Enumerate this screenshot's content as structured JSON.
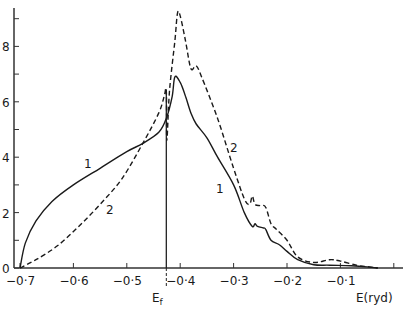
{
  "chart_data": {
    "type": "line",
    "title": "",
    "xlabel": "E(ryd)",
    "ylabel": "",
    "xlim": [
      -0.7,
      0.0
    ],
    "ylim": [
      0,
      9.5
    ],
    "grid": false,
    "x_ticks": [
      "-0·7",
      "-0·6",
      "-0·5",
      "-0·4",
      "-0·3",
      "-0·2",
      "-0·1"
    ],
    "y_ticks": [
      "0",
      "2",
      "4",
      "6",
      "8"
    ],
    "annotations": [
      {
        "text": "E_f",
        "x": -0.426,
        "note": "Fermi energy vertical line"
      },
      {
        "text": "1",
        "series": "1",
        "positions": [
          "left branch",
          "right branch"
        ]
      },
      {
        "text": "2",
        "series": "2",
        "positions": [
          "left branch",
          "right branch"
        ]
      }
    ],
    "series": [
      {
        "name": "1",
        "style": "solid",
        "x": [
          -0.7,
          -0.69,
          -0.67,
          -0.64,
          -0.6,
          -0.55,
          -0.5,
          -0.47,
          -0.44,
          -0.426,
          -0.415,
          -0.41,
          -0.4,
          -0.39,
          -0.38,
          -0.37,
          -0.35,
          -0.33,
          -0.3,
          -0.28,
          -0.265,
          -0.26,
          -0.255,
          -0.245,
          -0.24,
          -0.23,
          -0.215,
          -0.2,
          -0.18,
          -0.15,
          -0.12,
          -0.08,
          -0.05,
          -0.03
        ],
        "y": [
          0.0,
          0.9,
          1.7,
          2.4,
          3.0,
          3.6,
          4.2,
          4.5,
          4.9,
          5.4,
          6.2,
          6.9,
          6.7,
          6.2,
          5.6,
          5.2,
          4.7,
          4.0,
          3.0,
          2.0,
          1.5,
          1.6,
          1.5,
          1.45,
          1.4,
          1.0,
          0.85,
          0.6,
          0.3,
          0.12,
          0.1,
          0.08,
          0.04,
          0.0
        ]
      },
      {
        "name": "2",
        "style": "dashed",
        "x": [
          -0.7,
          -0.67,
          -0.63,
          -0.59,
          -0.55,
          -0.51,
          -0.47,
          -0.44,
          -0.43,
          -0.426,
          -0.425,
          -0.42,
          -0.41,
          -0.405,
          -0.4,
          -0.39,
          -0.38,
          -0.37,
          -0.36,
          -0.33,
          -0.3,
          -0.28,
          -0.27,
          -0.265,
          -0.26,
          -0.25,
          -0.24,
          -0.23,
          -0.22,
          -0.2,
          -0.18,
          -0.15,
          -0.12,
          -0.1,
          -0.07,
          -0.05,
          -0.03
        ],
        "y": [
          0.0,
          0.3,
          0.8,
          1.5,
          2.3,
          3.2,
          4.5,
          5.6,
          6.2,
          6.4,
          4.6,
          6.4,
          8.2,
          9.2,
          9.1,
          8.2,
          7.2,
          7.3,
          6.9,
          5.4,
          3.6,
          2.5,
          2.3,
          2.6,
          2.3,
          2.25,
          2.2,
          1.6,
          1.4,
          1.0,
          0.4,
          0.2,
          0.3,
          0.25,
          0.1,
          0.05,
          0.0
        ]
      }
    ]
  },
  "axis": {
    "x_label": "E(ryd)",
    "ef_label": "E",
    "ef_sub": "f",
    "series1_label": "1",
    "series2_label": "2"
  }
}
